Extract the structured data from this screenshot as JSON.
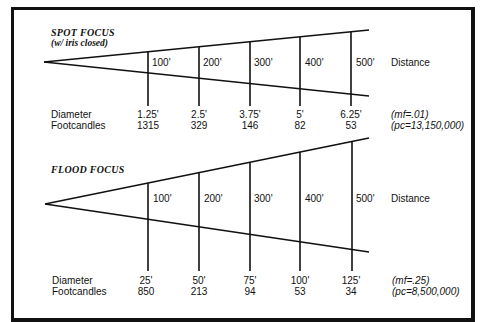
{
  "spot": {
    "title": "SPOT FOCUS",
    "subtitle": "(w/ iris closed)",
    "distances": [
      "100'",
      "200'",
      "300'",
      "400'",
      "500'"
    ],
    "distance_label": "Distance",
    "row_labels": {
      "diameter": "Diameter",
      "footcandles": "Footcandles"
    },
    "diameters": [
      "1.25'",
      "2.5'",
      "3.75'",
      "5'",
      "6.25'"
    ],
    "footcandles": [
      "1315",
      "329",
      "146",
      "82",
      "53"
    ],
    "mf_note": "(mf=.01)",
    "pc_note": "(pc=13,150,000)"
  },
  "flood": {
    "title": "FLOOD FOCUS",
    "distances": [
      "100'",
      "200'",
      "300'",
      "400'",
      "500'"
    ],
    "distance_label": "Distance",
    "row_labels": {
      "diameter": "Diameter",
      "footcandles": "Footcandles"
    },
    "diameters": [
      "25'",
      "50'",
      "75'",
      "100'",
      "125'"
    ],
    "footcandles": [
      "850",
      "213",
      "94",
      "53",
      "34"
    ],
    "mf_note": "(mf=.25)",
    "pc_note": "(pc=8,500,000)"
  },
  "colors": {
    "ink": "#111111",
    "background": "#ffffff"
  }
}
